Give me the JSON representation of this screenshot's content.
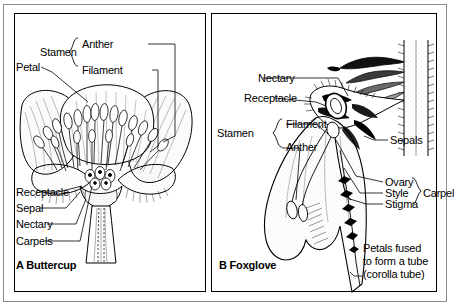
{
  "figure": {
    "background_color": "#ffffff",
    "line_color": "#000000",
    "frame_color": "#8b8b8b"
  },
  "panel_a": {
    "caption_letter": "A",
    "caption_name": "Buttercup",
    "caption_full": "A Buttercup",
    "labels": {
      "petal": "Petal",
      "stamen": "Stamen",
      "anther": "Anther",
      "filament": "Filament",
      "receptacle": "Receptacle",
      "sepal": "Sepal",
      "nectary": "Nectary",
      "carpels": "Carpels"
    }
  },
  "panel_b": {
    "caption_letter": "B",
    "caption_name": "Foxglove",
    "caption_full": "B  Foxglove",
    "labels": {
      "nectary": "Nectary",
      "receptacle": "Receptacle",
      "stamen": "Stamen",
      "filament": "Filament",
      "anther": "Anther",
      "sepals": "Sepals",
      "ovary": "Ovary",
      "style": "Style",
      "stigma": "Stigma",
      "carpel": "Carpel",
      "petals_fused_line1": "Petals fused",
      "petals_fused_line2": "to form a tube",
      "petals_fused_line3": "(corolla tube)"
    }
  }
}
